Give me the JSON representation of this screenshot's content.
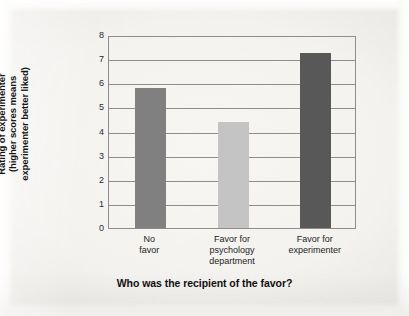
{
  "chart_data": {
    "type": "bar",
    "title": "",
    "subtitle": "",
    "xlabel": "Who was the recipient of the favor?",
    "ylabel": "Rating of experimenter (higher scores means experimenter better liked)",
    "ylabel_lines": [
      "Rating of experimenter",
      "(higher scores means",
      "experimenter better liked)"
    ],
    "categories": [
      "No favor",
      "Favor for psychology department",
      "Favor for experimenter"
    ],
    "category_lines": [
      [
        "No",
        "favor"
      ],
      [
        "Favor for",
        "psychology",
        "department"
      ],
      [
        "Favor for",
        "experimenter"
      ]
    ],
    "values": [
      5.8,
      4.4,
      7.25
    ],
    "bar_colors": [
      "#808080",
      "#c4c4c4",
      "#585858"
    ],
    "ylim": [
      0,
      8
    ],
    "ytick_values": [
      0,
      1,
      2,
      3,
      4,
      5,
      6,
      7,
      8
    ],
    "ytick_labels": [
      "0",
      "1",
      "2",
      "3",
      "4",
      "5",
      "6",
      "7",
      "8"
    ],
    "grid": true,
    "grid_color": "#8e8e8e",
    "legend": "none",
    "legend_position": "none",
    "annotations": []
  },
  "figure": {
    "background_color": "#f3f2ef",
    "axis_color": "#8e8e8e",
    "text_color": "#1d1d1d"
  }
}
